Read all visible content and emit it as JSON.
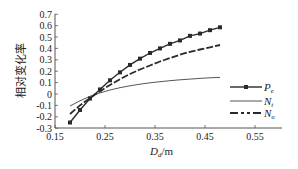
{
  "chart_data": {
    "type": "line",
    "title": "",
    "xlabel": "D_d/m",
    "xlabel_main": "D",
    "xlabel_sub": "d",
    "xlabel_unit": "/m",
    "ylabel": "相对变化率",
    "xlim": [
      0.15,
      0.6
    ],
    "ylim": [
      -0.3,
      0.7
    ],
    "xticks": [
      0.15,
      0.25,
      0.35,
      0.45,
      0.55
    ],
    "xtick_labels": [
      "0.15",
      "0.25",
      "0.35",
      "0.45",
      "0.55"
    ],
    "yticks": [
      -0.3,
      -0.2,
      -0.1,
      0,
      0.1,
      0.2,
      0.3,
      0.4,
      0.5,
      0.6,
      0.7
    ],
    "ytick_labels": [
      "-0.3",
      "-0.2",
      "-0.1",
      "0",
      "0.1",
      "0.2",
      "0.3",
      "0.4",
      "0.5",
      "0.6",
      "0.7"
    ],
    "grid": false,
    "legend_position": "lower right",
    "x": [
      0.18,
      0.2,
      0.22,
      0.24,
      0.26,
      0.28,
      0.3,
      0.32,
      0.34,
      0.36,
      0.38,
      0.4,
      0.42,
      0.44,
      0.46,
      0.48
    ],
    "series": [
      {
        "name": "P_e",
        "label_main": "P",
        "label_sub": "e",
        "style": "solid-square-markers",
        "values": [
          -0.25,
          -0.14,
          -0.04,
          0.04,
          0.12,
          0.19,
          0.255,
          0.31,
          0.36,
          0.4,
          0.44,
          0.47,
          0.51,
          0.53,
          0.56,
          0.585
        ]
      },
      {
        "name": "N_t",
        "label_main": "N",
        "label_sub": "t",
        "style": "thin-solid",
        "values": [
          -0.105,
          -0.06,
          -0.02,
          0.01,
          0.035,
          0.055,
          0.072,
          0.086,
          0.098,
          0.108,
          0.117,
          0.125,
          0.131,
          0.137,
          0.142,
          0.146
        ]
      },
      {
        "name": "N_u",
        "label_main": "N",
        "label_sub": "u",
        "style": "dash",
        "values": [
          -0.175,
          -0.1,
          -0.035,
          0.025,
          0.08,
          0.13,
          0.175,
          0.215,
          0.25,
          0.285,
          0.315,
          0.345,
          0.37,
          0.39,
          0.41,
          0.43
        ]
      }
    ]
  },
  "colors": {
    "line": "#2a2a2a",
    "axis": "#555555",
    "text": "#222222"
  }
}
